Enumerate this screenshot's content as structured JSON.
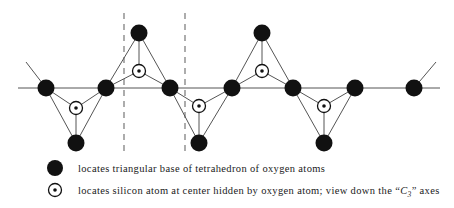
{
  "figure": {
    "type": "silicate-chain-structure-diagram",
    "colors": {
      "atom_fill": "#111111",
      "bond_line": "#555555",
      "axis_line": "#555555",
      "dashed_line": "#888888",
      "silicon_outline": "#111111",
      "silicon_fill": "#ffffff",
      "background": "#ffffff",
      "text": "#1a1a1a"
    },
    "geometry": {
      "axis_y": 88,
      "axis_x_start": 18,
      "axis_x_end": 440,
      "apex_up_y": 33,
      "apex_down_y": 143,
      "dashed_x": [
        124,
        185
      ],
      "dashed_y_top": 13,
      "dashed_y_bottom": 155,
      "oxygen_radius": 8.5,
      "silicon_outer_radius": 6.5,
      "silicon_inner_radius": 1.8
    },
    "axis_nodes": [
      {
        "name": "bridging-oxygen-1",
        "x": 46,
        "y": 88
      },
      {
        "name": "bridging-oxygen-2",
        "x": 106,
        "y": 88
      },
      {
        "name": "bridging-oxygen-3",
        "x": 170,
        "y": 88
      },
      {
        "name": "bridging-oxygen-4",
        "x": 232,
        "y": 88
      },
      {
        "name": "bridging-oxygen-5",
        "x": 293,
        "y": 88
      },
      {
        "name": "bridging-oxygen-6",
        "x": 355,
        "y": 88
      },
      {
        "name": "bridging-oxygen-7",
        "x": 414,
        "y": 88
      }
    ],
    "apex_nodes": [
      {
        "name": "apex-oxygen-up-1",
        "x": 139,
        "y": 33
      },
      {
        "name": "apex-oxygen-down-1",
        "x": 199,
        "y": 143
      },
      {
        "name": "apex-oxygen-up-2",
        "x": 262,
        "y": 33
      },
      {
        "name": "apex-oxygen-down-2",
        "x": 324,
        "y": 143
      }
    ],
    "edge_oxygens": [
      {
        "name": "terminal-oxygen-left",
        "x": 46,
        "y": 88
      },
      {
        "name": "terminal-oxygen-right",
        "x": 414,
        "y": 88
      }
    ],
    "silicon_nodes": [
      {
        "name": "silicon-center-1",
        "x": 76,
        "y": 108
      },
      {
        "name": "silicon-center-2",
        "x": 139,
        "y": 71
      },
      {
        "name": "silicon-center-3",
        "x": 199,
        "y": 106
      },
      {
        "name": "silicon-center-4",
        "x": 262,
        "y": 71
      },
      {
        "name": "silicon-center-5",
        "x": 324,
        "y": 106
      }
    ],
    "tetrahedra": [
      {
        "name": "tetrahedron-down-1",
        "orientation": "down",
        "v1": [
          46,
          88
        ],
        "v2": [
          106,
          88
        ],
        "apex": [
          76,
          143
        ],
        "si": [
          76,
          108
        ]
      },
      {
        "name": "tetrahedron-up-1",
        "orientation": "up",
        "v1": [
          106,
          88
        ],
        "v2": [
          170,
          88
        ],
        "apex": [
          139,
          33
        ],
        "si": [
          139,
          71
        ]
      },
      {
        "name": "tetrahedron-down-2",
        "orientation": "down",
        "v1": [
          170,
          88
        ],
        "v2": [
          232,
          88
        ],
        "apex": [
          199,
          143
        ],
        "si": [
          199,
          106
        ]
      },
      {
        "name": "tetrahedron-up-2",
        "orientation": "up",
        "v1": [
          232,
          88
        ],
        "v2": [
          293,
          88
        ],
        "apex": [
          262,
          33
        ],
        "si": [
          262,
          71
        ]
      },
      {
        "name": "tetrahedron-down-3",
        "orientation": "down",
        "v1": [
          293,
          88
        ],
        "v2": [
          355,
          88
        ],
        "apex": [
          324,
          143
        ],
        "si": [
          324,
          106
        ]
      }
    ],
    "stubs": [
      {
        "name": "continuation-stub-left",
        "x1": 46,
        "y1": 88,
        "x2": 26,
        "y2": 62
      },
      {
        "name": "continuation-stub-right",
        "x1": 414,
        "y1": 88,
        "x2": 436,
        "y2": 62
      }
    ]
  },
  "legend": {
    "rows": [
      {
        "symbol": "filled-circle",
        "symbol_x": 55,
        "symbol_y": 168,
        "text_x": 78,
        "text_y": 172,
        "text": "locates triangular base of tetrahedron of oxygen atoms"
      },
      {
        "symbol": "dotted-circle",
        "symbol_x": 55,
        "symbol_y": 190,
        "text_x": 78,
        "text_y": 194,
        "text_before": "locates silicon atom at center hidden by oxygen atom; view down the “",
        "text_symbol": "C",
        "text_subscript": "3",
        "text_after": "” axes"
      }
    ]
  }
}
